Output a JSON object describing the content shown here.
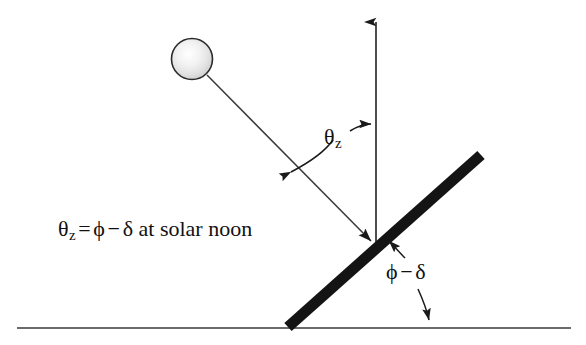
{
  "figure": {
    "background_color": "#ffffff",
    "line_color": "#333333",
    "bar_color": "#111111",
    "text_color": "#111111",
    "width": 586,
    "height": 345
  },
  "labels": {
    "equation": {
      "symbol": "θ",
      "subscript": "z",
      "equals": "=",
      "phi": "ϕ",
      "minus": "−",
      "delta": "δ",
      "suffix": "at solar noon",
      "full_text": "θz = ϕ − δ at solar noon"
    },
    "zenith_angle": {
      "symbol": "θ",
      "subscript": "z",
      "full_text": "θz"
    },
    "tilt_angle": {
      "phi": "ϕ",
      "minus": "−",
      "delta": "δ",
      "full_text": "ϕ − δ"
    }
  },
  "elements": {
    "sun": {
      "name": "sun",
      "cx": 192,
      "cy": 59,
      "r": 21
    },
    "sun_ray": {
      "name": "sun-ray",
      "x1": 207,
      "y1": 75,
      "x2": 373,
      "y2": 243
    },
    "zenith_arrow": {
      "name": "zenith-vertical-arrow",
      "x1": 376,
      "y1": 246,
      "x2": 376,
      "y2": 12
    },
    "collector_bar": {
      "name": "tilted-collector",
      "x1": 288,
      "y1": 327,
      "x2": 481,
      "y2": 155,
      "thickness": 11
    },
    "ground_line": {
      "name": "ground-line",
      "x1": 17,
      "y1": 328,
      "x2": 571,
      "y2": 328
    },
    "theta_arc": {
      "name": "zenith-angle-arc"
    },
    "tilt_leader_up": {
      "name": "tilt-angle-leader-to-collector"
    },
    "tilt_leader_down": {
      "name": "tilt-angle-leader-to-ground"
    }
  }
}
